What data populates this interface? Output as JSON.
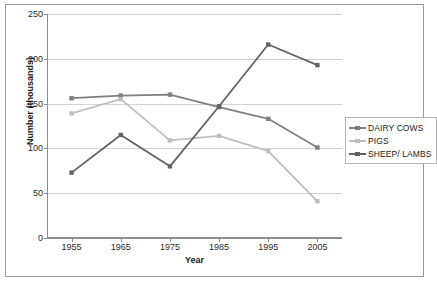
{
  "chart_data": {
    "type": "line",
    "title": "",
    "xlabel": "Year",
    "ylabel": "Number (thousands)",
    "categories": [
      "1955",
      "1965",
      "1975",
      "1985",
      "1995",
      "2005"
    ],
    "x": [
      1955,
      1965,
      1975,
      1985,
      1995,
      2005
    ],
    "xlim": [
      1950,
      2010
    ],
    "ylim": [
      0,
      250
    ],
    "yticks": [
      0,
      50,
      100,
      150,
      200,
      250
    ],
    "ytick_labels": [
      "0",
      "50",
      "100",
      "150",
      "200",
      "250"
    ],
    "grid": "horizontal",
    "legend_position": "right",
    "series": [
      {
        "name": "DAIRY COWS",
        "color": "#808080",
        "marker": "square",
        "values": [
          156,
          159,
          160,
          146,
          133,
          101
        ]
      },
      {
        "name": "PIGS",
        "color": "#bfbfbf",
        "marker": "square",
        "values": [
          139,
          155,
          109,
          114,
          97,
          41
        ]
      },
      {
        "name": "SHEEP/ LAMBS",
        "color": "#636363",
        "marker": "square",
        "values": [
          73,
          115,
          80,
          147,
          216,
          193
        ]
      }
    ]
  },
  "legend": {
    "items": [
      {
        "label": "DAIRY COWS"
      },
      {
        "label": "PIGS"
      },
      {
        "label": "SHEEP/ LAMBS"
      }
    ]
  },
  "colors": {
    "frame": "#9a9a9a",
    "gridline": "#d2d2d2",
    "axis": "#8d8d8d",
    "text": "#1a1a1a",
    "background": "#ffffff"
  }
}
